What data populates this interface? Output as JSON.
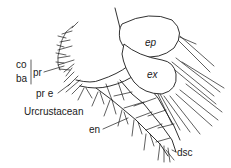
{
  "figure": {
    "title": "Urcrustacean",
    "labels": {
      "co": "co",
      "ba": "ba",
      "pr": "pr",
      "pre": "pr e",
      "ep": "ep",
      "ex": "ex",
      "en": "en",
      "dsc": "dsc",
      "caption": "Urcrustacean"
    },
    "colors": {
      "ink": "#1a1a1a",
      "background": "#ffffff"
    }
  }
}
